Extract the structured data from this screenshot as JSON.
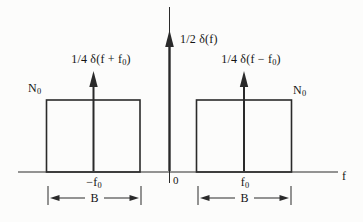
{
  "diagram": {
    "colors": {
      "background": "#fcfcfb",
      "line": "#2a2a2a",
      "text": "#141414"
    },
    "axis": {
      "x_label": "f",
      "origin_label": "0"
    },
    "center_impulse": {
      "label": "1/2 δ(f)"
    },
    "left_band": {
      "level": {
        "base": "N",
        "sub": "0"
      },
      "impulse": {
        "pre": "1/4 δ(f + f",
        "sub": "0",
        "post": ")"
      },
      "center_freq": {
        "pre": "−f",
        "sub": "0"
      },
      "bandwidth_label": "B"
    },
    "right_band": {
      "level": {
        "base": "N",
        "sub": "0"
      },
      "impulse": {
        "pre": "1/4 δ(f − f",
        "sub": "0",
        "post": ")"
      },
      "center_freq": {
        "pre": "f",
        "sub": "0"
      },
      "bandwidth_label": "B"
    }
  }
}
